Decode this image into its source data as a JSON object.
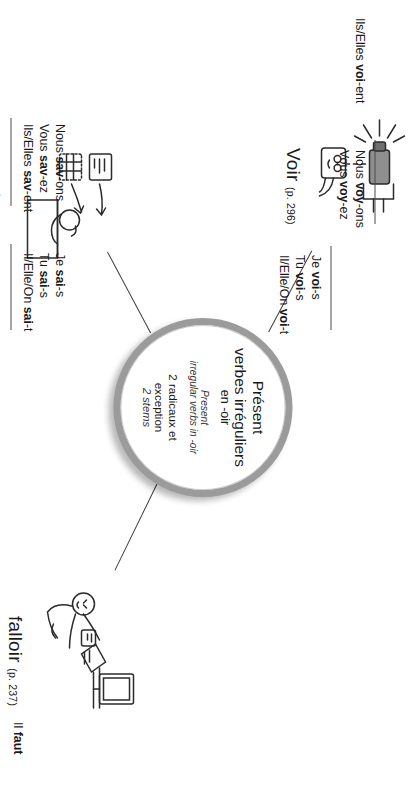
{
  "page": {
    "title": "Présent verbes irréguliers en -oir",
    "orientation_note": "rotated"
  },
  "hub": {
    "title_line1": "Présent",
    "title_line2": "verbes irréguliers",
    "title_line3": "en -oir",
    "subtitle_line1": "Present",
    "subtitle_line2": "irregular verbs in -oir",
    "note_line1": "2 radicaux et",
    "note_line2": "exception",
    "note_line3": "2 stems",
    "ring_color": "#9b9b9b"
  },
  "branches": [
    {
      "id": "voir",
      "verb": "Voir",
      "page_ref": "(p. 296)",
      "icon": "projector-light-and-face-icon",
      "forms_group1": [
        {
          "pronoun": "Je ",
          "stem": "voi",
          "ending": "-s"
        },
        {
          "pronoun": "Tu ",
          "stem": "voi",
          "ending": "-s"
        },
        {
          "pronoun": "Il/Elle/On ",
          "stem": "voi",
          "ending": "-t"
        }
      ],
      "forms_group2": [
        {
          "pronoun": "Nous ",
          "stem": "voy",
          "ending": "-ons"
        },
        {
          "pronoun": "Vous ",
          "stem": "voy",
          "ending": "-ez"
        }
      ],
      "forms_group3": [
        {
          "pronoun": "Ils/Elles ",
          "stem": "voi",
          "ending": "-ent"
        }
      ]
    },
    {
      "id": "savoir",
      "verb": "savoir",
      "page_ref": "(p. 275)",
      "icon": "person-at-desk-and-books-icon",
      "forms_group1": [
        {
          "pronoun": "Je ",
          "stem": "sai",
          "ending": "-s"
        },
        {
          "pronoun": "Tu ",
          "stem": "sai",
          "ending": "-s"
        },
        {
          "pronoun": "Il/Elle/On ",
          "stem": "sai",
          "ending": "-t"
        }
      ],
      "forms_group2": [
        {
          "pronoun": "Nous ",
          "stem": "sav",
          "ending": "-ons"
        },
        {
          "pronoun": "Vous ",
          "stem": "sav",
          "ending": "-ez"
        },
        {
          "pronoun": "Ils/Elles ",
          "stem": "sav",
          "ending": "-ent"
        }
      ]
    },
    {
      "id": "falloir",
      "verb": "falloir",
      "page_ref": "(p. 237)",
      "icon": "person-with-laptop-and-tv-icon",
      "forms_group1": [
        {
          "pronoun": "Il ",
          "stem": "faut",
          "ending": ""
        }
      ]
    }
  ]
}
